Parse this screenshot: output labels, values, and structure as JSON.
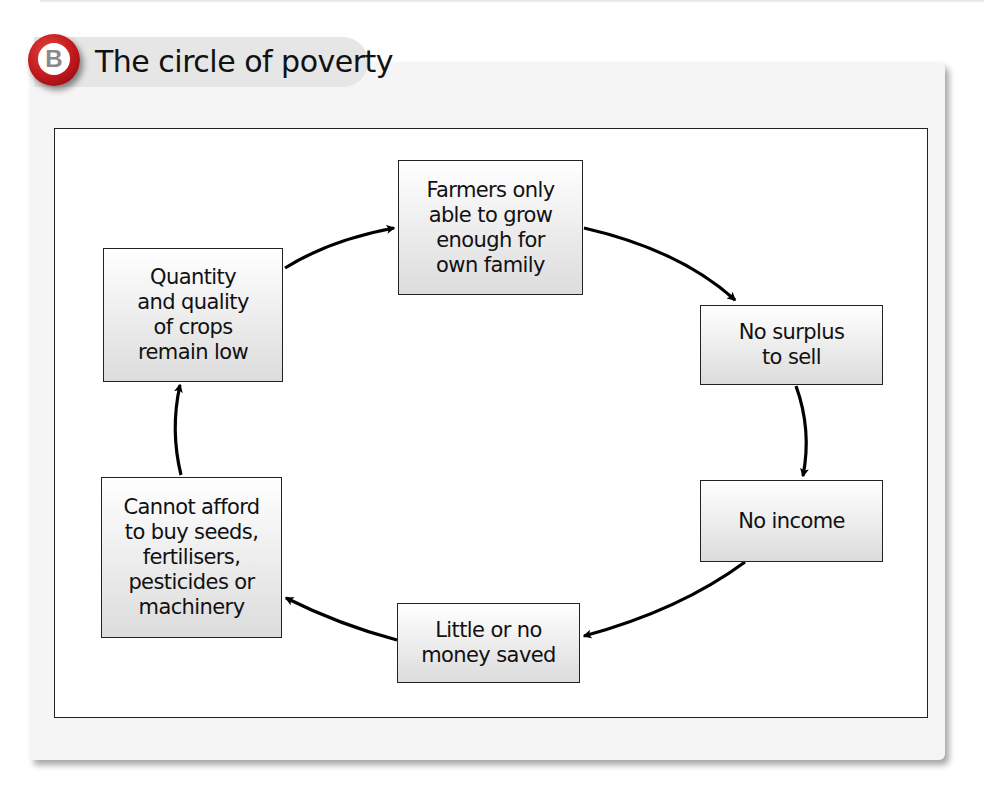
{
  "header": {
    "badge_letter": "B",
    "title": "The circle of poverty",
    "badge_color": "#c0171c"
  },
  "diagram": {
    "type": "cycle",
    "nodes": [
      {
        "id": "farmers",
        "label": "Farmers only\nable to grow\nenough for\nown family"
      },
      {
        "id": "surplus",
        "label": "No surplus\nto sell"
      },
      {
        "id": "income",
        "label": "No income"
      },
      {
        "id": "savings",
        "label": "Little or no\nmoney saved"
      },
      {
        "id": "afford",
        "label": "Cannot afford\nto buy seeds,\nfertilisers,\npesticides or\nmachinery"
      },
      {
        "id": "crops",
        "label": "Quantity\nand quality\nof crops\nremain low"
      }
    ],
    "edges": [
      {
        "from": "farmers",
        "to": "surplus"
      },
      {
        "from": "surplus",
        "to": "income"
      },
      {
        "from": "income",
        "to": "savings"
      },
      {
        "from": "savings",
        "to": "afford"
      },
      {
        "from": "afford",
        "to": "crops"
      },
      {
        "from": "crops",
        "to": "farmers"
      }
    ]
  }
}
